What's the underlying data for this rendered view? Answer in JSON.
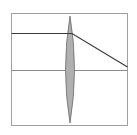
{
  "diagram": {
    "type": "converging-lens-ray-diagram",
    "frame": {
      "x": 11,
      "y": 13,
      "width": 117,
      "height": 113,
      "stroke": "#a0a0a0"
    },
    "optical_axis": {
      "y": 70,
      "stroke": "#8a8a8a"
    },
    "lens": {
      "cx": 70,
      "top": 16,
      "bottom": 123,
      "half_width": 7,
      "fill": "#b0b0b0",
      "stroke": "#6a6a6a"
    },
    "ray": {
      "points": [
        [
          11,
          33
        ],
        [
          72,
          33
        ],
        [
          128,
          67
        ]
      ],
      "stroke": "#3a3a3a"
    }
  }
}
